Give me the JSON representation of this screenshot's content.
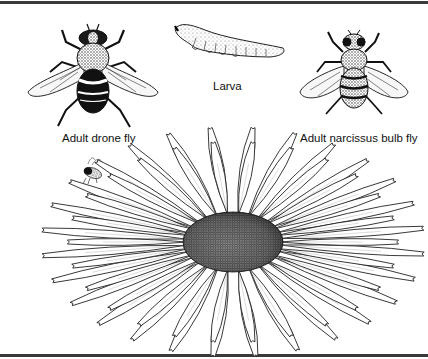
{
  "figure": {
    "labels": {
      "drone_fly": "Adult drone fly",
      "larva": "Larva",
      "narcissus_fly": "Adult narcissus bulb fly"
    },
    "illustrations": [
      {
        "name": "drone-fly",
        "description": "Black-and-white line drawing of an adult drone fly, dorsal view, wings spread"
      },
      {
        "name": "larva",
        "description": "Line drawing of a stippled segmented larva"
      },
      {
        "name": "narcissus-bulb-fly",
        "description": "Line drawing of a hairy adult narcissus bulb fly, dorsal view"
      },
      {
        "name": "small-fly",
        "description": "Small fly hovering near flower"
      },
      {
        "name": "daisy",
        "description": "Large daisy flower with stippled center disc and many white petals"
      }
    ],
    "colors": {
      "ink": "#111111",
      "background": "#ffffff",
      "frame": "#3a3a3a"
    }
  }
}
